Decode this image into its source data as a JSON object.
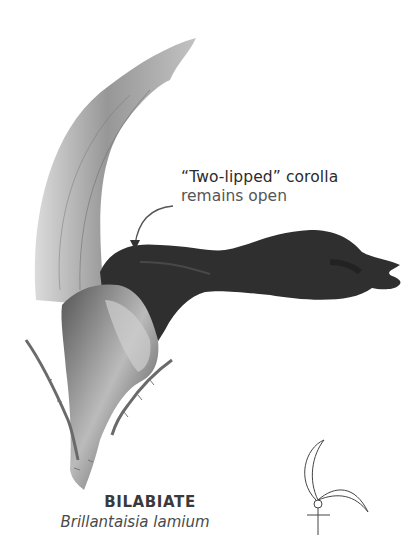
{
  "figure": {
    "type": "botanical-illustration"
  },
  "callout": {
    "title": "“Two-lipped” corolla",
    "subtitle": "remains open",
    "pointer": "curved-arrow"
  },
  "caption": {
    "name": "BILABIATE",
    "species": "Brillantaisia lamium"
  },
  "symbol": {
    "icon": "bilabiate-floral-diagram-icon"
  },
  "colors": {
    "background": "#ffffff",
    "corolla": "#2e2e2e",
    "upper_lip": "#9a9a9a",
    "text": "#2b2b2b"
  }
}
